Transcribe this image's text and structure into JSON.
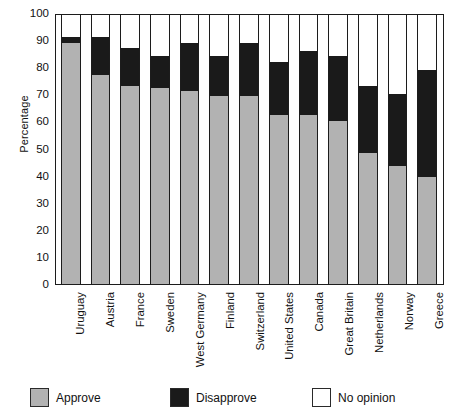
{
  "chart_data": {
    "type": "bar",
    "subtype": "stacked-bar-100",
    "title": "",
    "xlabel": "",
    "ylabel": "Percentage",
    "ylim": [
      0,
      100
    ],
    "yticks": [
      0,
      10,
      20,
      30,
      40,
      50,
      60,
      70,
      80,
      90,
      100
    ],
    "grid": false,
    "legend_position": "bottom",
    "categories": [
      "Uruguay",
      "Austria",
      "France",
      "Sweden",
      "West Germany",
      "Finland",
      "Switzerland",
      "United States",
      "Canada",
      "Great Britain",
      "Netherlands",
      "Norway",
      "Greece"
    ],
    "series": [
      {
        "name": "Approve",
        "color": "#b2b2b2",
        "values": [
          90,
          78,
          74,
          73,
          72,
          70,
          70,
          63,
          63,
          61,
          49,
          44,
          40
        ]
      },
      {
        "name": "Disapprove",
        "color": "#1a1a1a",
        "values": [
          2,
          14,
          14,
          12,
          18,
          15,
          20,
          20,
          24,
          24,
          25,
          27,
          40
        ]
      },
      {
        "name": "No opinion",
        "color": "#ffffff",
        "values": [
          8,
          8,
          12,
          15,
          10,
          15,
          10,
          17,
          13,
          15,
          26,
          29,
          20
        ]
      }
    ]
  },
  "axis": {
    "y_title": "Percentage",
    "y_tick_labels": [
      "100",
      "90",
      "80",
      "70",
      "60",
      "50",
      "40",
      "30",
      "20",
      "10",
      "0"
    ]
  },
  "legend": {
    "items": [
      {
        "label": "Approve",
        "swatch": "approve-swatch"
      },
      {
        "label": "Disapprove",
        "swatch": "disapprove-swatch"
      },
      {
        "label": "No opinion",
        "swatch": "no-opinion-swatch"
      }
    ]
  }
}
